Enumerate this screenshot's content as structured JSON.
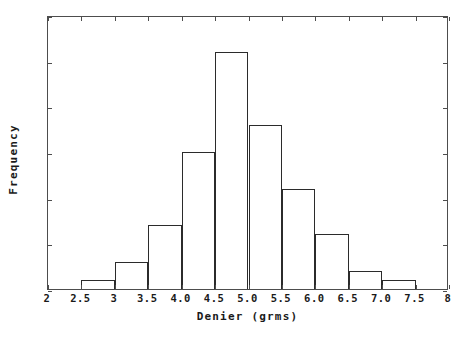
{
  "chart_data": {
    "type": "bar",
    "title": "",
    "xlabel": "Denier (grms)",
    "ylabel": "Frequency",
    "xlim": [
      2,
      8
    ],
    "ylim": [
      0,
      30
    ],
    "grid": false,
    "legend": null,
    "bin_width": 0.5,
    "categories": [
      "2.5-3.0",
      "3.0-3.5",
      "3.5-4.0",
      "4.0-4.5",
      "4.5-5.0",
      "5.0-5.5",
      "5.5-6.0",
      "6.0-6.5",
      "6.5-7.0",
      "7.0-7.5"
    ],
    "bin_edges": [
      2.5,
      3.0,
      3.5,
      4.0,
      4.5,
      5.0,
      5.5,
      6.0,
      6.5,
      7.0,
      7.5
    ],
    "values": [
      1,
      3,
      7,
      15,
      26,
      18,
      11,
      6,
      2,
      1
    ],
    "x_tick_values": [
      2,
      2.5,
      3,
      3.5,
      4,
      4.5,
      5,
      5.5,
      6,
      6.5,
      7,
      7.5,
      8
    ],
    "x_tick_labels": [
      "2",
      "2.5",
      "3",
      "3.5",
      "4.0",
      "4.5",
      "5.0",
      "5.5",
      "6.0",
      "6.5",
      "7.0",
      "7.5",
      "8"
    ],
    "y_tick_values": [
      0,
      5,
      10,
      15,
      20,
      25,
      30
    ],
    "y_tick_labels": [
      "0",
      "5",
      "10",
      "15",
      "20",
      "25",
      "30"
    ],
    "bar_edge_color": "#2b2b2b",
    "bar_fill_color": "none",
    "axis_color": "#4d4d4d",
    "background_color": "#ffffff"
  }
}
